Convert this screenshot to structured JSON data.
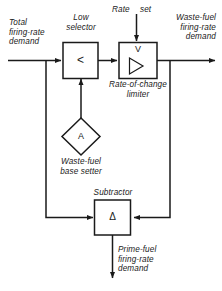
{
  "diagram": {
    "stroke_color": "#1a1a1a",
    "fill_color": "#ffffff",
    "background": "#ffffff",
    "blocks": [
      {
        "id": "low-selector",
        "shape": "rect",
        "caption": "Low\nselector",
        "symbol": "<"
      },
      {
        "id": "rate-of-change-limiter",
        "shape": "rect",
        "caption": "Rate-of-change\nlimiter",
        "symbol": "V",
        "symbol2": "ramp-triangle"
      },
      {
        "id": "waste-fuel-base-setter",
        "shape": "diamond",
        "caption": "Waste-fuel\nbase setter",
        "symbol": "A"
      },
      {
        "id": "subtractor",
        "shape": "rect",
        "caption": "Subtractor",
        "symbol": "Δ"
      }
    ],
    "signals": {
      "total_firing_rate_demand": "Total\nfiring-rate\ndemand",
      "rate_set_left": "Rate",
      "rate_set_right": "set",
      "waste_fuel_firing_rate_demand": "Waste-fuel\nfiring-rate\ndemand",
      "prime_fuel_firing_rate_demand": "Prime-fuel\nfiring-rate\ndemand"
    },
    "captions": {
      "low_selector": "Low\nselector",
      "rate_of_change_limiter": "Rate-of-change\nlimiter",
      "waste_fuel_base_setter": "Waste-fuel\nbase setter",
      "subtractor": "Subtractor"
    },
    "symbols": {
      "low_selector": "<",
      "limiter_v": "V",
      "base_setter": "A",
      "subtractor": "Δ"
    }
  }
}
